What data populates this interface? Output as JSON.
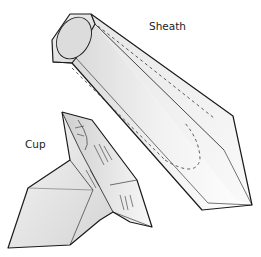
{
  "figure": {
    "labels": {
      "sheath": "Sheath",
      "cup": "Cup"
    }
  },
  "colors": {
    "outline": "#1a1a1a",
    "fill_light": "#f4f4f4",
    "fill_mid": "#e2e2e2",
    "fill_dark": "#cfcfcf",
    "label_text": "#222222"
  }
}
